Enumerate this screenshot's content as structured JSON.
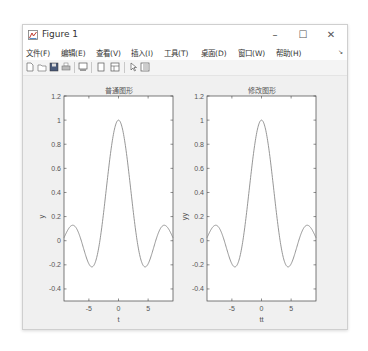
{
  "window": {
    "title": "Figure 1",
    "controls": {
      "minimize": "–",
      "maximize": "☐",
      "close": "✕"
    }
  },
  "menubar": {
    "items": [
      {
        "label": "文件(F)"
      },
      {
        "label": "编辑(E)"
      },
      {
        "label": "查看(V)"
      },
      {
        "label": "插入(I)"
      },
      {
        "label": "工具(T)"
      },
      {
        "label": "桌面(D)"
      },
      {
        "label": "窗口(W)"
      },
      {
        "label": "帮助(H)"
      }
    ],
    "overflow_icon": "↘"
  },
  "toolbar": {
    "icons": [
      "new-figure-icon",
      "open-file-icon",
      "save-icon",
      "print-icon",
      "print-preview-icon",
      "hide-plot-tools-icon",
      "show-plot-tools-icon",
      "edit-plot-arrow-icon",
      "property-inspector-icon"
    ]
  },
  "colors": {
    "line": "#8a8a8a",
    "axes_border": "#444444",
    "tick_text": "#555555",
    "figure_bg": "#f0f0f0",
    "axes_bg": "#ffffff"
  },
  "chart_data": [
    {
      "type": "line",
      "title": "普通图形",
      "xlabel": "t",
      "ylabel": "y",
      "function": "sin(t)/t",
      "xlim": [
        -9.2,
        9.2
      ],
      "ylim": [
        -0.5,
        1.2
      ],
      "xticks": [
        -5,
        0,
        5
      ],
      "xtick_labels": [
        "-5",
        "0",
        "5"
      ],
      "yticks": [
        1.2,
        1,
        0.8,
        0.6,
        0.4,
        0.2,
        0,
        -0.2,
        -0.4
      ],
      "ytick_labels": [
        "1.2",
        "1",
        "0.8",
        "0.6",
        "0.4",
        "0.2",
        "0",
        "-0.2",
        "-0.4"
      ],
      "grid": false,
      "key_points": [
        {
          "x": -9.2,
          "y": 0.024
        },
        {
          "x": -7.73,
          "y": 0.128
        },
        {
          "x": -4.49,
          "y": -0.217
        },
        {
          "x": -3.14,
          "y": 0
        },
        {
          "x": 0,
          "y": 1
        },
        {
          "x": 3.14,
          "y": 0
        },
        {
          "x": 4.49,
          "y": -0.217
        },
        {
          "x": 7.73,
          "y": 0.128
        },
        {
          "x": 9.2,
          "y": 0.024
        }
      ]
    },
    {
      "type": "line",
      "title": "修改图形",
      "xlabel": "tt",
      "ylabel": "yy",
      "function": "sin(t)/t",
      "xlim": [
        -9.2,
        9.2
      ],
      "ylim": [
        -0.5,
        1.2
      ],
      "xticks": [
        -5,
        0,
        5
      ],
      "xtick_labels": [
        "-5",
        "0",
        "5"
      ],
      "yticks": [
        1.2,
        1,
        0.8,
        0.6,
        0.4,
        0.2,
        0,
        -0.2,
        -0.4
      ],
      "ytick_labels": [
        "1.2",
        "1",
        "0.8",
        "0.6",
        "0.4",
        "0.2",
        "0",
        "-0.2",
        "-0.4"
      ],
      "grid": false,
      "key_points": [
        {
          "x": -9.2,
          "y": 0.024
        },
        {
          "x": -7.73,
          "y": 0.128
        },
        {
          "x": -4.49,
          "y": -0.217
        },
        {
          "x": -3.14,
          "y": 0
        },
        {
          "x": 0,
          "y": 1
        },
        {
          "x": 3.14,
          "y": 0
        },
        {
          "x": 4.49,
          "y": -0.217
        },
        {
          "x": 7.73,
          "y": 0.128
        },
        {
          "x": 9.2,
          "y": 0.024
        }
      ]
    }
  ]
}
